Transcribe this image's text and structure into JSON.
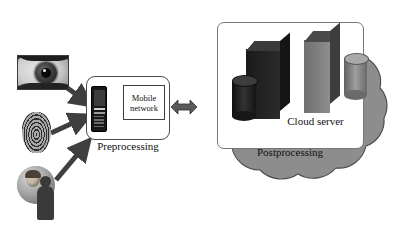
{
  "diagram": {
    "type": "flow-diagram"
  },
  "inputs": [
    {
      "name": "iris-sample",
      "label": "",
      "icon": "eye-iris-image"
    },
    {
      "name": "fingerprint-sample",
      "label": "",
      "icon": "fingerprint-image"
    },
    {
      "name": "face-sample",
      "label": "",
      "icon": "face-photo-image"
    }
  ],
  "preprocessing": {
    "label": "Preprocessing",
    "device_icon": "mobile-phone-icon",
    "network_box": {
      "line1": "Mobile",
      "line2": "network"
    }
  },
  "link": {
    "icon": "bidirectional-arrow-icon"
  },
  "cloud": {
    "server_label": "Cloud server",
    "postprocessing_label": "Postprocessing",
    "server_icons": [
      "server-rack-dark-icon",
      "server-cylinder-dark-icon",
      "server-rack-gray-icon",
      "server-cylinder-gray-icon"
    ]
  },
  "colors": {
    "cloud_fill": "#8d8d8d",
    "cloud_stroke": "#4a4a4a",
    "box_stroke": "#4a4a4a",
    "server_dark": "#1f1f1f",
    "server_gray": "#7b7b7b",
    "arrow_fill": "#3f3f3f",
    "background": "#ffffff"
  }
}
